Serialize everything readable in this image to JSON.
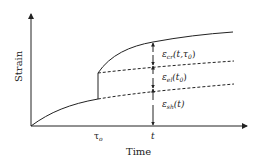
{
  "figure": {
    "type": "strain-time diagram",
    "y_axis_label": "Strain",
    "x_axis_label": "Time",
    "x_ticks": [
      {
        "label": "τ",
        "subscript": "o"
      },
      {
        "label": "t",
        "subscript": ""
      }
    ],
    "components": [
      {
        "name": "creep strain",
        "symbol": "ε",
        "subscript": "cr",
        "args": "(t,τ",
        "args_sub": "0",
        "args_end": ")"
      },
      {
        "name": "elastic strain",
        "symbol": "ε",
        "subscript": "el",
        "args": "(t",
        "args_sub": "0",
        "args_end": ")"
      },
      {
        "name": "shrinkage strain",
        "symbol": "ε",
        "subscript": "sh",
        "args": "(t)",
        "args_sub": "",
        "args_end": ""
      }
    ],
    "colors": {
      "line": "#222222",
      "background": "#ffffff"
    }
  }
}
